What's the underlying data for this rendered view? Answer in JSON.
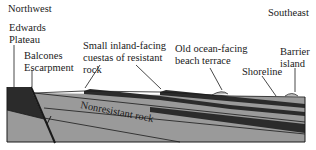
{
  "diagram": {
    "type": "geologic-cross-section",
    "directions": {
      "left": "Northwest",
      "right": "Southeast"
    },
    "labels": {
      "edwards_plateau": [
        "Edwards",
        "Plateau"
      ],
      "balcones_escarpment": [
        "Balcones",
        "Escarpment"
      ],
      "cuestas": [
        "Small inland-facing",
        "cuestas of resistant",
        "rock"
      ],
      "beach_terrace": [
        "Old ocean-facing",
        "beach terrace"
      ],
      "shoreline": "Shoreline",
      "barrier_island": [
        "Barrier",
        "island"
      ],
      "nonresistant_rock": "Nonresistant rock"
    },
    "colors": {
      "resistant_rock": "#2b2b2b",
      "nonresistant_rock": "#9a9a9a",
      "outline": "#1a1a1a",
      "sand": "#b8b8b8"
    }
  }
}
